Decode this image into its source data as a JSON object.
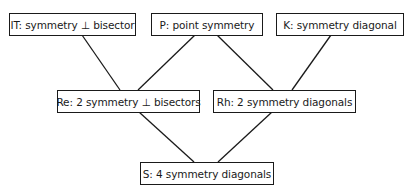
{
  "diagram": {
    "type": "hierarchy",
    "nodes": [
      {
        "id": "IT",
        "label": "IT: symmetry ⊥ bisector",
        "level": 0
      },
      {
        "id": "P",
        "label": "P: point symmetry",
        "level": 0
      },
      {
        "id": "K",
        "label": "K: symmetry diagonal",
        "level": 0
      },
      {
        "id": "Re",
        "label": "Re: 2 symmetry ⊥ bisectors",
        "level": 1
      },
      {
        "id": "Rh",
        "label": "Rh: 2 symmetry diagonals",
        "level": 1
      },
      {
        "id": "S",
        "label": "S: 4 symmetry diagonals",
        "level": 2
      }
    ],
    "edges": [
      {
        "from": "IT",
        "to": "Re"
      },
      {
        "from": "P",
        "to": "Re"
      },
      {
        "from": "P",
        "to": "Rh"
      },
      {
        "from": "K",
        "to": "Rh"
      },
      {
        "from": "Re",
        "to": "S"
      },
      {
        "from": "Rh",
        "to": "S"
      }
    ]
  }
}
